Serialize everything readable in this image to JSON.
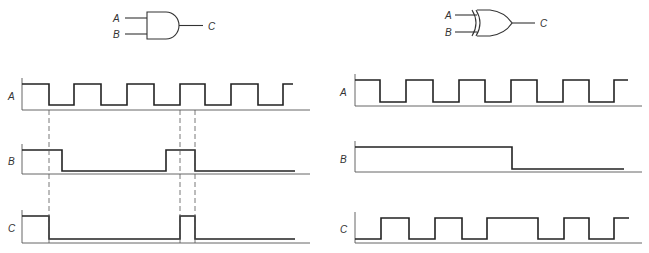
{
  "left_panel": {
    "gate": {
      "type": "AND",
      "inputs": [
        "A",
        "B"
      ],
      "output": "C"
    },
    "signals": [
      {
        "name": "A",
        "axis_y": 110,
        "high_y": 84,
        "low_y": 105,
        "x0": 22,
        "x_end": 293,
        "start": 1,
        "transitions": [
          49,
          74,
          101,
          127,
          154,
          180,
          205,
          231,
          258,
          283
        ]
      },
      {
        "name": "B",
        "axis_y": 174,
        "high_y": 150,
        "low_y": 171,
        "x0": 22,
        "x_end": 295,
        "start": 1,
        "transitions": [
          62,
          166,
          195
        ]
      },
      {
        "name": "C",
        "axis_y": 243,
        "high_y": 216,
        "low_y": 239,
        "x0": 22,
        "x_end": 295,
        "start": 1,
        "transitions": [
          49,
          180,
          195
        ]
      }
    ],
    "axis_x_start": 22,
    "axis_x_end": 310,
    "dashed_guides": [
      49,
      180,
      195
    ]
  },
  "right_panel": {
    "gate": {
      "type": "XOR",
      "inputs": [
        "A",
        "B"
      ],
      "output": "C"
    },
    "signals": [
      {
        "name": "A",
        "axis_y": 106,
        "high_y": 80,
        "low_y": 102,
        "x0": 355,
        "x_end": 628,
        "start": 1,
        "transitions": [
          380,
          406,
          433,
          459,
          485,
          511,
          537,
          563,
          589,
          614
        ]
      },
      {
        "name": "B",
        "axis_y": 172,
        "high_y": 147,
        "low_y": 169,
        "x0": 355,
        "x_end": 624,
        "start": 1,
        "transitions": [
          512
        ]
      },
      {
        "name": "C",
        "axis_y": 243,
        "high_y": 218,
        "low_y": 239,
        "x0": 355,
        "x_end": 629,
        "start": 0,
        "transitions": [
          381,
          409,
          435,
          462,
          487,
          538,
          564,
          589,
          614
        ]
      }
    ],
    "axis_x_start": 355,
    "axis_x_end": 642
  },
  "labels": {
    "and_in_a": "A",
    "and_in_b": "B",
    "and_out": "C",
    "xor_in_a": "A",
    "xor_in_b": "B",
    "xor_out": "C",
    "left_a": "A",
    "left_b": "B",
    "left_c": "C",
    "right_a": "A",
    "right_b": "B",
    "right_c": "C"
  }
}
